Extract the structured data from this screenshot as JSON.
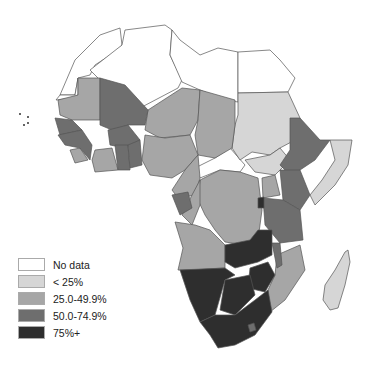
{
  "map": {
    "region": "Africa",
    "colors": {
      "no_data": "#ffffff",
      "lt25": "#d6d6d6",
      "25_49": "#a6a6a6",
      "50_74": "#6e6e6e",
      "75_plus": "#2e2e2e"
    }
  },
  "legend": {
    "items": [
      {
        "label": "No data",
        "color": "#ffffff"
      },
      {
        "label": "< 25%",
        "color": "#d6d6d6"
      },
      {
        "label": "25.0-49.9%",
        "color": "#a6a6a6"
      },
      {
        "label": "50.0-74.9%",
        "color": "#6e6e6e"
      },
      {
        "label": "75%+",
        "color": "#2e2e2e"
      }
    ]
  }
}
